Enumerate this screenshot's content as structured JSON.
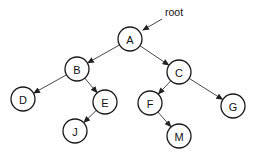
{
  "diagram": {
    "type": "binary-tree",
    "root_label": "root",
    "nodes": [
      {
        "id": "A",
        "label": "A",
        "x": 130,
        "y": 39
      },
      {
        "id": "B",
        "label": "B",
        "x": 77,
        "y": 69
      },
      {
        "id": "C",
        "label": "C",
        "x": 179,
        "y": 72
      },
      {
        "id": "D",
        "label": "D",
        "x": 23,
        "y": 99
      },
      {
        "id": "E",
        "label": "E",
        "x": 105,
        "y": 102
      },
      {
        "id": "F",
        "label": "F",
        "x": 150,
        "y": 103
      },
      {
        "id": "G",
        "label": "G",
        "x": 233,
        "y": 106
      },
      {
        "id": "J",
        "label": "J",
        "x": 75,
        "y": 131
      },
      {
        "id": "M",
        "label": "M",
        "x": 179,
        "y": 136
      }
    ],
    "edges": [
      [
        "A",
        "B"
      ],
      [
        "A",
        "C"
      ],
      [
        "B",
        "D"
      ],
      [
        "B",
        "E"
      ],
      [
        "C",
        "F"
      ],
      [
        "C",
        "G"
      ],
      [
        "E",
        "J"
      ],
      [
        "F",
        "M"
      ]
    ]
  }
}
